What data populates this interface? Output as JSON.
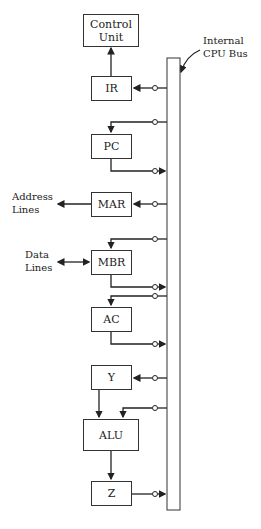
{
  "diagram": {
    "bus_label_line1": "Internal",
    "bus_label_line2": "CPU Bus",
    "registers": {
      "control_unit_line1": "Control",
      "control_unit_line2": "Unit",
      "ir": "IR",
      "pc": "PC",
      "mar": "MAR",
      "mbr": "MBR",
      "ac": "AC",
      "y": "Y",
      "alu": "ALU",
      "z": "Z"
    },
    "external": {
      "address_line1": "Address",
      "address_line2": "Lines",
      "data_line1": "Data",
      "data_line2": "Lines"
    }
  }
}
